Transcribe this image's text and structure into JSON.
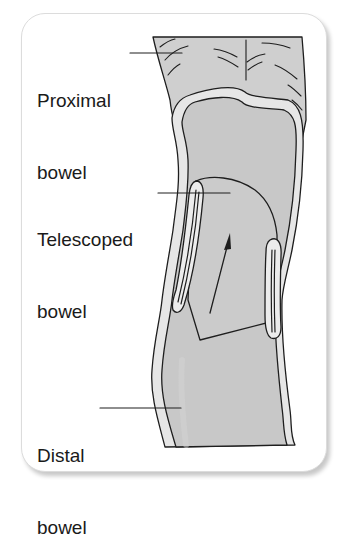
{
  "figure": {
    "labels": [
      {
        "id": "proximal",
        "line1": "Proximal",
        "line2": "bowel"
      },
      {
        "id": "telescoped",
        "line1": "Telescoped",
        "line2": "bowel"
      },
      {
        "id": "distal",
        "line1": "Distal",
        "line2": "bowel"
      }
    ],
    "arrow": {
      "direction": "up",
      "meaning": "direction of telescoping"
    },
    "colors": {
      "bowel_fill": "#c9c9c9",
      "bowel_fill_dark": "#bdbdbd",
      "wall_fill": "#e9e9e9",
      "outline": "#1e1e1e",
      "card_border": "#dcdcdc",
      "text": "#1a1a1a"
    }
  }
}
